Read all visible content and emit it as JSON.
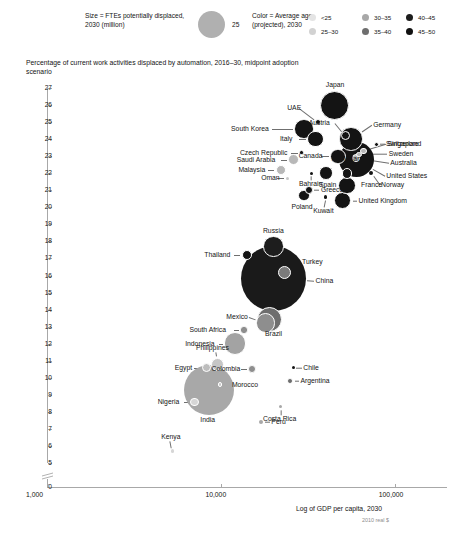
{
  "legend": {
    "size_text": "Size = FTEs potentially displaced, 2030 (million)",
    "size_value": "25",
    "color_text": "Color = Average age (projected), 2030",
    "keys": [
      {
        "label": "<25",
        "color": "#e4e4e4"
      },
      {
        "label": "25–30",
        "color": "#d2d2d2"
      },
      {
        "label": "30–35",
        "color": "#a8a8a8"
      },
      {
        "label": "35–40",
        "color": "#6e6e6e"
      },
      {
        "label": "40–45",
        "color": "#1d1d1d"
      },
      {
        "label": "45–50",
        "color": "#111111"
      }
    ]
  },
  "chart_data": {
    "type": "scatter",
    "title": "Percentage of current work activities displaced by automation, 2016–30, midpoint adoption scenario",
    "xlabel": "Log of GDP per capita, 2030",
    "xlabel_sub": "2010 real $",
    "ylabel": "",
    "xscale": "log",
    "xlim": [
      1000,
      200000
    ],
    "xticks": [
      "1,000",
      "10,000",
      "100,000"
    ],
    "xtick_values": [
      1000,
      10000,
      100000
    ],
    "ylim": [
      5,
      27
    ],
    "yticks": [
      27,
      26,
      25,
      24,
      23,
      22,
      21,
      20,
      19,
      18,
      17,
      16,
      15,
      14,
      13,
      12,
      11,
      10,
      9,
      8,
      7,
      6,
      5
    ],
    "y_zero_label": "0",
    "axis_break": true,
    "grid": false,
    "legend_position": "top",
    "size_field": "FTEs potentially displaced, 2030 (million)",
    "color_field": "Average age (projected), 2030",
    "points": [
      {
        "name": "Japan",
        "x": 45000,
        "y": 26.0,
        "size": 20.0,
        "color": "#141414",
        "label_dx": 0,
        "label_dy": -20,
        "label_anchor": "center"
      },
      {
        "name": "UAE",
        "x": 36000,
        "y": 25.0,
        "size": 1.0,
        "color": "#141414",
        "label_dx": -20,
        "label_dy": -14,
        "label_anchor": "end"
      },
      {
        "name": "South Korea",
        "x": 30000,
        "y": 24.6,
        "size": 9.0,
        "color": "#141414",
        "label_dx": -34,
        "label_dy": 0,
        "label_anchor": "end"
      },
      {
        "name": "Austria",
        "x": 52000,
        "y": 24.2,
        "size": 2.0,
        "color": "#141414",
        "label_dx": -12,
        "label_dy": -13,
        "label_anchor": "end"
      },
      {
        "name": "Germany",
        "x": 56000,
        "y": 24.0,
        "size": 13.0,
        "color": "#141414",
        "label_dx": 22,
        "label_dy": -14,
        "label_anchor": "start"
      },
      {
        "name": "Switzerland",
        "x": 78000,
        "y": 23.7,
        "size": 0.6,
        "color": "#141414",
        "label_dx": 10,
        "label_dy": 0,
        "label_anchor": "start"
      },
      {
        "name": "Italy",
        "x": 35000,
        "y": 24.0,
        "size": 6.5,
        "color": "#141414",
        "label_dx": -18,
        "label_dy": 0,
        "label_anchor": "end"
      },
      {
        "name": "Canada",
        "x": 47000,
        "y": 23.0,
        "size": 5.5,
        "color": "#141414",
        "label_dx": -18,
        "label_dy": 0,
        "label_anchor": "end"
      },
      {
        "name": "Singapore",
        "x": 66000,
        "y": 23.3,
        "size": 1.0,
        "color": "#b8b8b8",
        "label_dx": 24,
        "label_dy": -7,
        "label_anchor": "start"
      },
      {
        "name": "Sweden",
        "x": 62000,
        "y": 23.1,
        "size": 0.8,
        "color": "#b8b8b8",
        "label_dx": 30,
        "label_dy": 0,
        "label_anchor": "start"
      },
      {
        "name": "Australia",
        "x": 60000,
        "y": 22.9,
        "size": 1.6,
        "color": "#b8b8b8",
        "label_dx": 34,
        "label_dy": 5,
        "label_anchor": "start"
      },
      {
        "name": "United States",
        "x": 60000,
        "y": 22.8,
        "size": 30.0,
        "color": "#141414",
        "label_dx": 30,
        "label_dy": 16,
        "label_anchor": "start"
      },
      {
        "name": "Norway",
        "x": 73000,
        "y": 22.0,
        "size": 0.4,
        "color": "#141414",
        "label_dx": 10,
        "label_dy": 12,
        "label_anchor": "start"
      },
      {
        "name": "Czech Republic",
        "x": 29000,
        "y": 23.2,
        "size": 0.5,
        "color": "#141414",
        "label_dx": -12,
        "label_dy": 0,
        "label_anchor": "end"
      },
      {
        "name": "Saudi Arabia",
        "x": 26000,
        "y": 22.8,
        "size": 3.0,
        "color": "#b8b8b8",
        "label_dx": -14,
        "label_dy": 0,
        "label_anchor": "end"
      },
      {
        "name": "Malaysia",
        "x": 22000,
        "y": 22.2,
        "size": 2.6,
        "color": "#b8b8b8",
        "label_dx": -14,
        "label_dy": 0,
        "label_anchor": "end"
      },
      {
        "name": "Oman",
        "x": 24000,
        "y": 21.7,
        "size": 0.3,
        "color": "#c8c8c8",
        "label_dx": -12,
        "label_dy": 0,
        "label_anchor": "end"
      },
      {
        "name": "Bahrain",
        "x": 33000,
        "y": 22.0,
        "size": 0.2,
        "color": "#141414",
        "label_dx": 0,
        "label_dy": 11,
        "label_anchor": "center"
      },
      {
        "name": "Spain",
        "x": 40000,
        "y": 22.0,
        "size": 4.5,
        "color": "#141414",
        "label_dx": 2,
        "label_dy": 12,
        "label_anchor": "center"
      },
      {
        "name": "Netherlands",
        "x": 53000,
        "y": 22.0,
        "size": 2.8,
        "color": "#141414",
        "label_dx": 4,
        "label_dy": -14,
        "label_anchor": "center"
      },
      {
        "name": "France",
        "x": 53000,
        "y": 21.3,
        "size": 7.0,
        "color": "#141414",
        "label_dx": 14,
        "label_dy": 0,
        "label_anchor": "start"
      },
      {
        "name": "Greece",
        "x": 32000,
        "y": 21.0,
        "size": 1.4,
        "color": "#141414",
        "label_dx": 12,
        "label_dy": 0,
        "label_anchor": "start"
      },
      {
        "name": "Poland",
        "x": 30000,
        "y": 20.7,
        "size": 3.2,
        "color": "#141414",
        "label_dx": -2,
        "label_dy": 12,
        "label_anchor": "center"
      },
      {
        "name": "Kuwait",
        "x": 40000,
        "y": 20.6,
        "size": 0.2,
        "color": "#141414",
        "label_dx": -2,
        "label_dy": 14,
        "label_anchor": "center"
      },
      {
        "name": "United Kingdom",
        "x": 50000,
        "y": 20.4,
        "size": 7.5,
        "color": "#141414",
        "label_dx": 16,
        "label_dy": 0,
        "label_anchor": "start"
      },
      {
        "name": "Russia",
        "x": 20000,
        "y": 17.7,
        "size": 10.0,
        "color": "#1d1d1d",
        "label_dx": 0,
        "label_dy": -16,
        "label_anchor": "center"
      },
      {
        "name": "Thailand",
        "x": 14000,
        "y": 17.2,
        "size": 2.5,
        "color": "#141414",
        "label_dx": -14,
        "label_dy": 0,
        "label_anchor": "end"
      },
      {
        "name": "Turkey",
        "x": 23000,
        "y": 16.2,
        "size": 4.0,
        "color": "#7b7b7b",
        "label_dx": 18,
        "label_dy": -10,
        "label_anchor": "start"
      },
      {
        "name": "China",
        "x": 20000,
        "y": 15.8,
        "size": 100.0,
        "color": "#1a1a1a",
        "label_dx": 42,
        "label_dy": 2,
        "label_anchor": "start"
      },
      {
        "name": "Mexico",
        "x": 18000,
        "y": 13.2,
        "size": 9.0,
        "color": "#8e8e8e",
        "label_dx": -18,
        "label_dy": -6,
        "label_anchor": "end"
      },
      {
        "name": "Brazil",
        "x": 19000,
        "y": 13.4,
        "size": 15.0,
        "color": "#6e6e6e",
        "label_dx": 6,
        "label_dy": 14,
        "label_anchor": "center"
      },
      {
        "name": "South Africa",
        "x": 13500,
        "y": 12.8,
        "size": 1.2,
        "color": "#8e8e8e",
        "label_dx": -12,
        "label_dy": 0,
        "label_anchor": "end"
      },
      {
        "name": "Indonesia",
        "x": 12000,
        "y": 12.0,
        "size": 12.0,
        "color": "#a3a3a3",
        "label_dx": -18,
        "label_dy": 0,
        "label_anchor": "end"
      },
      {
        "name": "Philippines",
        "x": 9500,
        "y": 10.8,
        "size": 4.0,
        "color": "#c6c6c6",
        "label_dx": -2,
        "label_dy": -16,
        "label_anchor": "center"
      },
      {
        "name": "Egypt",
        "x": 8200,
        "y": 10.6,
        "size": 2.0,
        "color": "#bdbdbd",
        "label_dx": -14,
        "label_dy": 0,
        "label_anchor": "end"
      },
      {
        "name": "Colombia",
        "x": 15000,
        "y": 10.5,
        "size": 1.4,
        "color": "#8e8e8e",
        "label_dx": -12,
        "label_dy": 0,
        "label_anchor": "end"
      },
      {
        "name": "Chile",
        "x": 26000,
        "y": 10.6,
        "size": 0.3,
        "color": "#141414",
        "label_dx": 10,
        "label_dy": 0,
        "label_anchor": "start"
      },
      {
        "name": "Argentina",
        "x": 25000,
        "y": 9.8,
        "size": 0.8,
        "color": "#6e6e6e",
        "label_dx": 10,
        "label_dy": 0,
        "label_anchor": "start"
      },
      {
        "name": "Morocco",
        "x": 9800,
        "y": 9.6,
        "size": 0.5,
        "color": "#c6c6c6",
        "label_dx": 12,
        "label_dy": 0,
        "label_anchor": "start"
      },
      {
        "name": "India",
        "x": 8500,
        "y": 9.3,
        "size": 60.0,
        "color": "#a8a8a8",
        "label_dx": 0,
        "label_dy": 30,
        "label_anchor": "center"
      },
      {
        "name": "Nigeria",
        "x": 7000,
        "y": 8.6,
        "size": 1.6,
        "color": "#d6d6d6",
        "label_dx": -12,
        "label_dy": 0,
        "label_anchor": "end"
      },
      {
        "name": "Costa Rica",
        "x": 22000,
        "y": 8.3,
        "size": 0.15,
        "color": "#a8a8a8",
        "label_dx": 0,
        "label_dy": 12,
        "label_anchor": "center"
      },
      {
        "name": "Peru",
        "x": 17000,
        "y": 7.4,
        "size": 0.4,
        "color": "#a8a8a8",
        "label_dx": 10,
        "label_dy": 0,
        "label_anchor": "start"
      },
      {
        "name": "Kenya",
        "x": 5200,
        "y": 5.7,
        "size": 0.2,
        "color": "#d6d6d6",
        "label_dx": -2,
        "label_dy": -14,
        "label_anchor": "center"
      }
    ]
  }
}
